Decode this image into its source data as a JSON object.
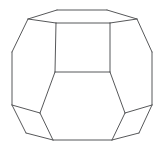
{
  "figure": {
    "shape_name": "truncated-octahedron",
    "projection": "oblique-perspective",
    "background_color": "#ffffff",
    "line_color": "#57585a",
    "line_width": 1,
    "fill_color": "#ffffff",
    "canvas": {
      "width": 165,
      "height": 157
    },
    "vertices": {
      "top_back_left": [
        57,
        10
      ],
      "top_back_right": [
        107,
        10
      ],
      "top_right_outer": [
        137,
        19
      ],
      "top_left_outer": [
        28,
        19
      ],
      "square_top_left": [
        56,
        23
      ],
      "square_top_right": [
        110,
        23
      ],
      "square_bot_left": [
        55,
        72
      ],
      "square_bot_right": [
        110,
        72
      ],
      "left_mid_upper": [
        12,
        52
      ],
      "right_mid_upper": [
        152,
        52
      ],
      "left_mid_lower": [
        12,
        105
      ],
      "right_mid_lower": [
        152,
        105
      ],
      "front_hex_left": [
        40,
        113
      ],
      "front_hex_right": [
        125,
        113
      ],
      "bottom_left": [
        53,
        140
      ],
      "bottom_right": [
        112,
        140
      ],
      "lower_left_outer": [
        26,
        133
      ],
      "lower_right_outer": [
        139,
        133
      ]
    },
    "faces": [
      {
        "name": "top-hexagon",
        "sides": 6,
        "points": "57,10 107,10 137,19 110,23 56,23 28,19"
      },
      {
        "name": "front-square",
        "sides": 4,
        "points": "56,23 110,23 110,72 55,72"
      },
      {
        "name": "front-hexagon",
        "sides": 6,
        "points": "55,72 110,72 125,113 112,140 53,140 40,113"
      },
      {
        "name": "left-upper-face",
        "sides": 5,
        "points": "28,19 56,23 55,72 40,113 12,105 12,52"
      },
      {
        "name": "right-upper-face",
        "sides": 5,
        "points": "137,19 152,52 152,105 125,113 110,72 110,23"
      },
      {
        "name": "bottom-left-quad",
        "sides": 4,
        "points": "12,105 40,113 53,140 26,133"
      },
      {
        "name": "bottom-right-quad",
        "sides": 4,
        "points": "152,105 139,133 112,140 125,113"
      }
    ],
    "edges": [
      {
        "name": "top-back-edge",
        "from": [
          57,
          10
        ],
        "to": [
          107,
          10
        ]
      },
      {
        "name": "top-right-back-edge",
        "from": [
          107,
          10
        ],
        "to": [
          137,
          19
        ]
      },
      {
        "name": "top-left-back-edge",
        "from": [
          57,
          10
        ],
        "to": [
          28,
          19
        ]
      },
      {
        "name": "top-right-front-edge",
        "from": [
          137,
          19
        ],
        "to": [
          110,
          23
        ]
      },
      {
        "name": "top-front-edge",
        "from": [
          110,
          23
        ],
        "to": [
          56,
          23
        ]
      },
      {
        "name": "top-left-front-edge",
        "from": [
          56,
          23
        ],
        "to": [
          28,
          19
        ]
      },
      {
        "name": "square-left-edge",
        "from": [
          56,
          23
        ],
        "to": [
          55,
          72
        ]
      },
      {
        "name": "square-right-edge",
        "from": [
          110,
          23
        ],
        "to": [
          110,
          72
        ]
      },
      {
        "name": "square-bottom-edge",
        "from": [
          55,
          72
        ],
        "to": [
          110,
          72
        ]
      },
      {
        "name": "left-upper-silhouette",
        "from": [
          28,
          19
        ],
        "to": [
          12,
          52
        ]
      },
      {
        "name": "left-vertical-edge",
        "from": [
          12,
          52
        ],
        "to": [
          12,
          105
        ]
      },
      {
        "name": "right-upper-silhouette",
        "from": [
          137,
          19
        ],
        "to": [
          152,
          52
        ]
      },
      {
        "name": "right-vertical-edge",
        "from": [
          152,
          52
        ],
        "to": [
          152,
          105
        ]
      },
      {
        "name": "left-diagonal-edge",
        "from": [
          55,
          72
        ],
        "to": [
          40,
          113
        ]
      },
      {
        "name": "right-diagonal-edge",
        "from": [
          110,
          72
        ],
        "to": [
          125,
          113
        ]
      },
      {
        "name": "left-quad-top-edge",
        "from": [
          12,
          105
        ],
        "to": [
          40,
          113
        ]
      },
      {
        "name": "right-quad-top-edge",
        "from": [
          152,
          105
        ],
        "to": [
          125,
          113
        ]
      },
      {
        "name": "left-quad-outer-edge",
        "from": [
          12,
          105
        ],
        "to": [
          26,
          133
        ]
      },
      {
        "name": "right-quad-outer-edge",
        "from": [
          152,
          105
        ],
        "to": [
          139,
          133
        ]
      },
      {
        "name": "left-quad-bottom-edge",
        "from": [
          26,
          133
        ],
        "to": [
          53,
          140
        ]
      },
      {
        "name": "right-quad-bottom-edge",
        "from": [
          139,
          133
        ],
        "to": [
          112,
          140
        ]
      },
      {
        "name": "front-hex-left-edge",
        "from": [
          40,
          113
        ],
        "to": [
          53,
          140
        ]
      },
      {
        "name": "front-hex-right-edge",
        "from": [
          125,
          113
        ],
        "to": [
          112,
          140
        ]
      },
      {
        "name": "bottom-front-edge",
        "from": [
          53,
          140
        ],
        "to": [
          112,
          140
        ]
      }
    ]
  }
}
